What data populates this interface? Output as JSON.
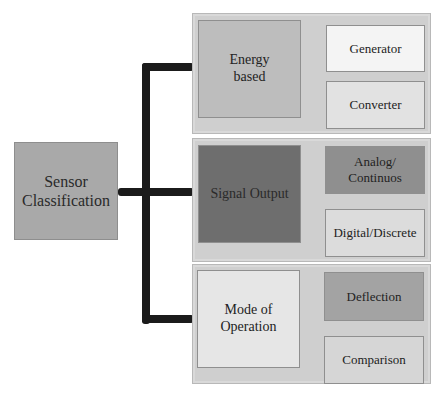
{
  "diagram": {
    "root": {
      "label_line1": "Sensor",
      "label_line2": "Classification",
      "color": "#a9a9a9"
    },
    "connector_color": "#1b1b1b",
    "categories": [
      {
        "label_line1": "Energy",
        "label_line2": "based",
        "color": "#bdbdbd",
        "children": [
          {
            "label_line1": "Generator",
            "label_line2": "",
            "color": "#f4f4f4"
          },
          {
            "label_line1": "Converter",
            "label_line2": "",
            "color": "#e2e2e2"
          }
        ]
      },
      {
        "label_line1": "Signal Output",
        "label_line2": "",
        "color": "#6e6e6e",
        "children": [
          {
            "label_line1": "Analog/",
            "label_line2": "Continuos",
            "color": "#8f8f8f"
          },
          {
            "label_line1": "Digital/Discrete",
            "label_line2": "",
            "color": "#dcdcdc"
          }
        ]
      },
      {
        "label_line1": "Mode of",
        "label_line2": "Operation",
        "color": "#e6e6e6",
        "children": [
          {
            "label_line1": "Deflection",
            "label_line2": "",
            "color": "#a3a3a3"
          },
          {
            "label_line1": "Comparison",
            "label_line2": "",
            "color": "#d6d6d6"
          }
        ]
      }
    ]
  }
}
